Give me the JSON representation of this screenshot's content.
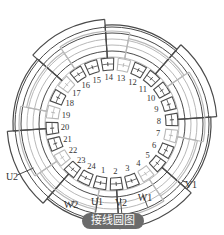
{
  "caption": "接线圆图",
  "top_text_fragment": "",
  "diagram": {
    "type": "stator-winding-connection-circle",
    "slots": [
      "1",
      "2",
      "3",
      "4",
      "5",
      "6",
      "7",
      "8",
      "9",
      "10",
      "11",
      "12",
      "13",
      "14",
      "15",
      "16",
      "17",
      "18",
      "19",
      "20",
      "21",
      "22",
      "23",
      "24"
    ],
    "terminals": [
      {
        "label": "U1",
        "x": 97,
        "y": 205
      },
      {
        "label": "V2",
        "x": 121,
        "y": 206
      },
      {
        "label": "W1",
        "x": 145,
        "y": 201
      },
      {
        "label": "V1",
        "x": 191,
        "y": 188
      },
      {
        "label": "W2",
        "x": 71,
        "y": 208
      },
      {
        "label": "U2",
        "x": 12,
        "y": 180
      }
    ],
    "colors": {
      "dark_line": "#4a4a4a",
      "light_line": "#b8b8b8",
      "text": "#333333",
      "caption_bg": "#6b6b6b",
      "caption_text": "#ffffff"
    }
  }
}
